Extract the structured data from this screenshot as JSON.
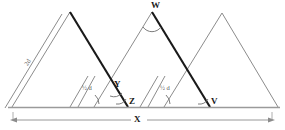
{
  "figure": {
    "background_color": "#ffffff",
    "line_color_thin": "#8c8c8c",
    "line_color_bold": "#1a1a1a",
    "arc_color": "#6e6e6e",
    "baseline_color": "#9a9a9a"
  },
  "labels": {
    "apex_w": "W",
    "point_y": "Y",
    "point_z": "Z",
    "point_v": "V",
    "span_x": "X",
    "side_2d": "2d",
    "half_d_left": "½ d",
    "half_d_right": "½ d"
  },
  "geometry": {
    "baseline_y": 107,
    "dimension_line_y": 120,
    "triangles": [
      {
        "name": "triangle-left",
        "apex": [
          70,
          12
        ],
        "left_base": [
          12,
          107
        ],
        "right_base": [
          128,
          107
        ]
      },
      {
        "name": "triangle-middle",
        "apex": [
          152,
          12
        ],
        "left_base": [
          94,
          107
        ],
        "right_base": [
          210,
          107
        ]
      },
      {
        "name": "triangle-right",
        "apex": [
          222,
          13
        ],
        "left_base": [
          164,
          107
        ],
        "right_base": [
          278,
          107
        ]
      }
    ],
    "bold_edges": [
      {
        "name": "bold-edge-left-triangle",
        "from": [
          70,
          12
        ],
        "to": [
          128,
          107
        ]
      },
      {
        "name": "bold-edge-middle-triangle",
        "from": [
          152,
          12
        ],
        "to": [
          210,
          107
        ]
      }
    ],
    "parallel_marks": [
      {
        "name": "parallel-line-far-left",
        "from": [
          62,
          15
        ],
        "to": [
          5,
          108
        ]
      },
      {
        "name": "parallel-line-inner-left",
        "from": [
          87,
          77
        ],
        "to": [
          70,
          107
        ]
      },
      {
        "name": "parallel-line-inner-right",
        "from": [
          163,
          77
        ],
        "to": [
          146,
          107
        ]
      }
    ],
    "angle_arcs": [
      {
        "name": "arc-apex-w",
        "center": [
          152,
          12
        ],
        "label": "W"
      },
      {
        "name": "arc-point-y",
        "center": [
          118,
          88
        ],
        "label": "Y"
      },
      {
        "name": "arc-point-z",
        "center": [
          128,
          107
        ],
        "label": "Z"
      },
      {
        "name": "arc-point-v",
        "center": [
          210,
          107
        ],
        "label": "V"
      },
      {
        "name": "arc-half-d-left",
        "center": [
          94,
          107
        ],
        "label": "½ d"
      },
      {
        "name": "arc-half-d-right",
        "center": [
          164,
          107
        ],
        "label": "½ d"
      }
    ]
  }
}
